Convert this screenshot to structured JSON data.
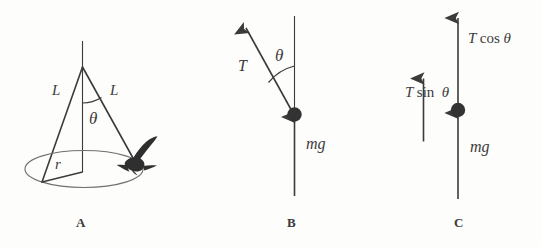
{
  "figure": {
    "background_color": "#fdfdfb",
    "stroke_color": "#3b3b3b",
    "width": 541,
    "height": 247
  },
  "panels": [
    {
      "id": "A",
      "letter": "A",
      "name": "conical-pendulum-perspective",
      "labels": {
        "length_left": "L",
        "length_right": "L",
        "angle": "θ",
        "radius": "r"
      },
      "elements": {
        "support_rod": "vertical-support-line",
        "circle_path": "horizontal-circular-path-ellipse",
        "bob": "bird-silhouette"
      }
    },
    {
      "id": "B",
      "letter": "B",
      "name": "free-body-tension-weight",
      "labels": {
        "tension": "T",
        "angle": "θ",
        "weight": "mg"
      },
      "elements": {
        "vertical_reference": "vertical-dashed-reference-line",
        "bob": "point-mass-dot"
      }
    },
    {
      "id": "C",
      "letter": "C",
      "name": "free-body-resolved-components",
      "labels": {
        "vertical_component": "T cos θ",
        "vertical_component_parts": {
          "symbol": "T",
          "fn": "cos",
          "angle": "θ"
        },
        "horizontal_component": "T sin θ",
        "horizontal_component_parts": {
          "symbol": "T",
          "fn": "sin",
          "angle": "θ"
        },
        "weight": "mg"
      },
      "elements": {
        "bob": "point-mass-dot"
      }
    }
  ]
}
